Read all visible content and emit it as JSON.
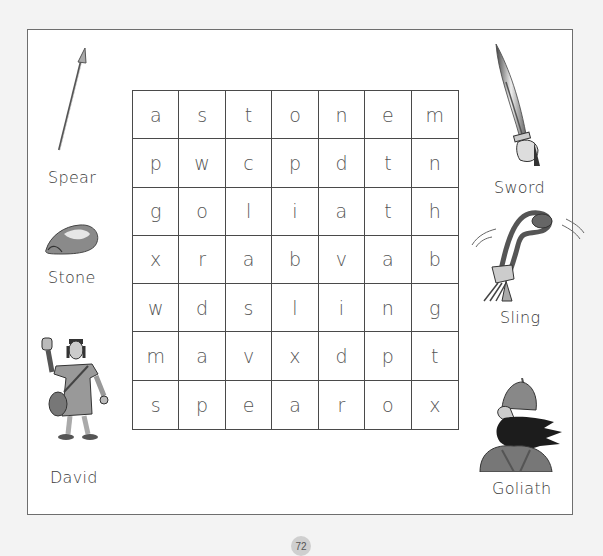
{
  "page": {
    "number": "72"
  },
  "puzzle": {
    "type": "word-search",
    "rows": [
      [
        "a",
        "s",
        "t",
        "o",
        "n",
        "e",
        "m"
      ],
      [
        "p",
        "w",
        "c",
        "p",
        "d",
        "t",
        "n"
      ],
      [
        "g",
        "o",
        "l",
        "i",
        "a",
        "t",
        "h"
      ],
      [
        "x",
        "r",
        "a",
        "b",
        "v",
        "a",
        "b"
      ],
      [
        "w",
        "d",
        "s",
        "l",
        "i",
        "n",
        "g"
      ],
      [
        "m",
        "a",
        "v",
        "x",
        "d",
        "p",
        "t"
      ],
      [
        "s",
        "p",
        "e",
        "a",
        "r",
        "o",
        "x"
      ]
    ]
  },
  "words": {
    "spear": "Spear",
    "stone": "Stone",
    "david": "David",
    "sword": "Sword",
    "sling": "Sling",
    "goliath": "Goliath"
  },
  "pictures": {
    "spear": "spear-icon",
    "stone": "stone-icon",
    "david": "david-illustration",
    "sword": "sword-icon",
    "sling": "sling-icon",
    "goliath": "goliath-illustration"
  }
}
